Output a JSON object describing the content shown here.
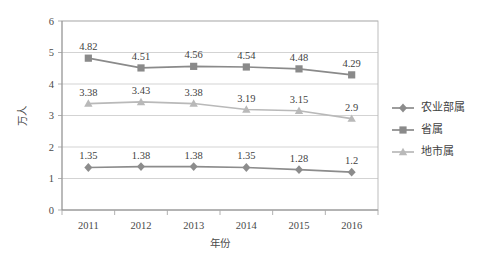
{
  "chart_data": {
    "type": "line",
    "title": "",
    "xlabel": "年份",
    "ylabel": "万人",
    "categories": [
      "2011",
      "2012",
      "2013",
      "2014",
      "2015",
      "2016"
    ],
    "ylim": [
      0,
      6
    ],
    "yticks": [
      "0",
      "1",
      "2",
      "3",
      "4",
      "5",
      "6"
    ],
    "grid": true,
    "legend_position": "right",
    "series": [
      {
        "name": "农业部属",
        "marker": "diamond",
        "color": "#8c8c8c",
        "values": [
          1.35,
          1.38,
          1.38,
          1.35,
          1.28,
          1.2
        ],
        "labels": [
          "1.35",
          "1.38",
          "1.38",
          "1.35",
          "1.28",
          "1.2"
        ]
      },
      {
        "name": "省属",
        "marker": "square",
        "color": "#8a8a8a",
        "values": [
          4.82,
          4.51,
          4.56,
          4.54,
          4.48,
          4.29
        ],
        "labels": [
          "4.82",
          "4.51",
          "4.56",
          "4.54",
          "4.48",
          "4.29"
        ]
      },
      {
        "name": "地市属",
        "marker": "triangle",
        "color": "#b9b9b9",
        "values": [
          3.38,
          3.43,
          3.38,
          3.19,
          3.15,
          2.9
        ],
        "labels": [
          "3.38",
          "3.43",
          "3.38",
          "3.19",
          "3.15",
          "2.9"
        ]
      }
    ]
  },
  "axes": {
    "y_title": "万人",
    "x_title": "年份"
  },
  "legend": {
    "items": [
      {
        "label": "农业部属"
      },
      {
        "label": "省属"
      },
      {
        "label": "地市属"
      }
    ]
  },
  "colors": {
    "series_1": "#8c8c8c",
    "series_2": "#8a8a8a",
    "series_3": "#b9b9b9",
    "grid": "#c8c8c8",
    "border": "#b5b5b5",
    "text": "#3f3f3f"
  }
}
